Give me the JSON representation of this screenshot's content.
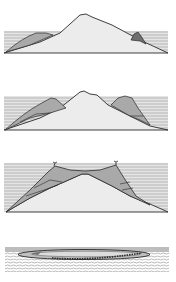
{
  "figure": {
    "panels": [
      {
        "stage": 1,
        "name": "fringing-reef",
        "label": ""
      },
      {
        "stage": 2,
        "name": "barrier-reef",
        "label": ""
      },
      {
        "stage": 3,
        "name": "atoll-cross-section",
        "label": ""
      },
      {
        "stage": 4,
        "name": "atoll-view",
        "label": ""
      }
    ],
    "colors": {
      "water": "#c9c9c9",
      "water_lines": "#e6e6e6",
      "island": "#ececec",
      "reef": "#a9a9a9",
      "reef_dark": "#6f6f6f",
      "outline": "#2a2a2a",
      "background": "#ffffff"
    }
  }
}
